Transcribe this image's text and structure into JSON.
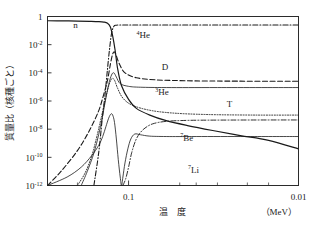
{
  "figure": {
    "kind": "scientific-plot",
    "background": "#ffffff",
    "ink": "#1a1a1a"
  },
  "axes": {
    "x_label": "温　度",
    "x_unit": "（MeV）",
    "x_ticks": [
      "0.1",
      "0.01"
    ],
    "y_label": "質量比（核種ごと）",
    "y_ticks": [
      "1",
      "10",
      "10",
      "10",
      "10",
      "10",
      "10"
    ],
    "y_tick_exponents": [
      "",
      "-2",
      "-4",
      "-6",
      "-8",
      "-10",
      "-12"
    ]
  },
  "chart_data": {
    "type": "line",
    "title": "",
    "xlabel": "温　度",
    "ylabel": "質量比（核種ごと）",
    "xunit": "MeV",
    "x_axis_scale": "log-reversed",
    "y_axis_scale": "log",
    "xlim": [
      0.3,
      0.01
    ],
    "ylim": [
      1e-12,
      1
    ],
    "grid": false,
    "legend": "inline-annotations",
    "x_tick_labels": [
      "0.1",
      "0.01"
    ],
    "y_tick_labels": [
      "1",
      "10^-2",
      "10^-4",
      "10^-6",
      "10^-8",
      "10^-10",
      "10^-12"
    ],
    "series": [
      {
        "name": "n",
        "label": "n",
        "style": "solid",
        "width": 1.2,
        "color": "#1a1a1a",
        "label_x": 0.205,
        "label_y": 0.15,
        "points": [
          [
            0.3,
            0.5
          ],
          [
            0.25,
            0.49
          ],
          [
            0.2,
            0.47
          ],
          [
            0.17,
            0.45
          ],
          [
            0.15,
            0.43
          ],
          [
            0.14,
            0.4
          ],
          [
            0.133,
            0.33
          ],
          [
            0.128,
            0.18
          ],
          [
            0.124,
            0.04
          ],
          [
            0.12,
            0.004
          ],
          [
            0.116,
            0.0002
          ],
          [
            0.11,
            1.2e-05
          ],
          [
            0.1,
            1.3e-06
          ],
          [
            0.09,
            3e-07
          ],
          [
            0.075,
            1e-07
          ],
          [
            0.06,
            4e-08
          ],
          [
            0.045,
            1.8e-08
          ],
          [
            0.032,
            8e-09
          ],
          [
            0.022,
            3.5e-09
          ],
          [
            0.015,
            1.6e-09
          ],
          [
            0.01,
            4e-10
          ]
        ]
      },
      {
        "name": "He4",
        "label": "4He",
        "mass_number": "4",
        "element": "He",
        "style": "dash-dot",
        "width": 1.1,
        "color": "#1a1a1a",
        "label_x": 0.082,
        "label_y": 0.03,
        "points": [
          [
            0.16,
            1e-12
          ],
          [
            0.15,
            2e-10
          ],
          [
            0.143,
            5e-08
          ],
          [
            0.138,
            2e-06
          ],
          [
            0.134,
            8e-05
          ],
          [
            0.13,
            0.003
          ],
          [
            0.126,
            0.06
          ],
          [
            0.122,
            0.2
          ],
          [
            0.118,
            0.24
          ],
          [
            0.11,
            0.25
          ],
          [
            0.09,
            0.25
          ],
          [
            0.06,
            0.25
          ],
          [
            0.03,
            0.25
          ],
          [
            0.01,
            0.25
          ]
        ]
      },
      {
        "name": "D",
        "label": "D",
        "style": "dashed",
        "width": 1.1,
        "color": "#1a1a1a",
        "label_x": 0.061,
        "label_y": 0.00015,
        "points": [
          [
            0.3,
            1e-12
          ],
          [
            0.25,
            1e-11
          ],
          [
            0.2,
            3e-10
          ],
          [
            0.17,
            8e-09
          ],
          [
            0.15,
            2e-07
          ],
          [
            0.14,
            3e-06
          ],
          [
            0.133,
            3e-05
          ],
          [
            0.128,
            0.0004
          ],
          [
            0.124,
            0.0022
          ],
          [
            0.121,
            0.003
          ],
          [
            0.118,
            0.0016
          ],
          [
            0.113,
            0.0004
          ],
          [
            0.105,
            0.0001
          ],
          [
            0.09,
            4.5e-05
          ],
          [
            0.07,
            3.2e-05
          ],
          [
            0.05,
            2.8e-05
          ],
          [
            0.03,
            2.6e-05
          ],
          [
            0.01,
            2.5e-05
          ]
        ]
      },
      {
        "name": "He3",
        "label": "3He",
        "mass_number": "3",
        "element": "He",
        "style": "solid-thin",
        "width": 0.8,
        "color": "#1a1a1a",
        "label_x": 0.0635,
        "label_y": 2.6e-06,
        "points": [
          [
            0.19,
            1e-12
          ],
          [
            0.175,
            1e-11
          ],
          [
            0.16,
            2e-10
          ],
          [
            0.15,
            4e-09
          ],
          [
            0.143,
            6e-08
          ],
          [
            0.137,
            1e-06
          ],
          [
            0.131,
            1.5e-05
          ],
          [
            0.126,
            7e-05
          ],
          [
            0.122,
            0.0001
          ],
          [
            0.118,
            5e-05
          ],
          [
            0.112,
            1.7e-05
          ],
          [
            0.1,
            1.1e-05
          ],
          [
            0.085,
            9.5e-06
          ],
          [
            0.06,
            9e-06
          ],
          [
            0.03,
            9e-06
          ],
          [
            0.01,
            9e-06
          ]
        ]
      },
      {
        "name": "T",
        "label": "T",
        "style": "dotted",
        "width": 0.9,
        "color": "#1a1a1a",
        "label_x": 0.0255,
        "label_y": 4e-07,
        "points": [
          [
            0.2,
            1e-12
          ],
          [
            0.18,
            8e-12
          ],
          [
            0.165,
            1.2e-10
          ],
          [
            0.155,
            2e-09
          ],
          [
            0.147,
            3e-08
          ],
          [
            0.14,
            4e-07
          ],
          [
            0.134,
            4e-06
          ],
          [
            0.129,
            2e-05
          ],
          [
            0.125,
            4e-05
          ],
          [
            0.121,
            3e-05
          ],
          [
            0.116,
            8e-06
          ],
          [
            0.108,
            1.6e-06
          ],
          [
            0.095,
            5e-07
          ],
          [
            0.075,
            2.2e-07
          ],
          [
            0.055,
            1.4e-07
          ],
          [
            0.035,
            1.1e-07
          ],
          [
            0.018,
            1e-07
          ],
          [
            0.01,
            1e-07
          ]
        ]
      },
      {
        "name": "Be7",
        "label": "7Be",
        "mass_number": "7",
        "element": "Be",
        "style": "dash-dot",
        "width": 0.9,
        "color": "#1a1a1a",
        "label_x": 0.0455,
        "label_y": 1.5e-09,
        "points": [
          [
            0.108,
            1e-12
          ],
          [
            0.104,
            3e-12
          ],
          [
            0.1,
            2e-11
          ],
          [
            0.096,
            2e-10
          ],
          [
            0.091,
            1.5e-09
          ],
          [
            0.086,
            5e-09
          ],
          [
            0.08,
            1.2e-08
          ],
          [
            0.072,
            2.4e-08
          ],
          [
            0.06,
            3.6e-08
          ],
          [
            0.045,
            4.2e-08
          ],
          [
            0.03,
            4.4e-08
          ],
          [
            0.015,
            4.5e-08
          ],
          [
            0.01,
            4.5e-08
          ]
        ]
      },
      {
        "name": "Li7",
        "label": "7Li",
        "mass_number": "7",
        "element": "Li",
        "style": "solid-thin",
        "width": 0.8,
        "color": "#1a1a1a",
        "label_x": 0.0415,
        "label_y": 8e-12,
        "points": [
          [
            0.3,
            1e-12
          ],
          [
            0.23,
            4e-12
          ],
          [
            0.19,
            2e-11
          ],
          [
            0.165,
            1.3e-10
          ],
          [
            0.15,
            7e-10
          ],
          [
            0.142,
            3e-09
          ],
          [
            0.136,
            1.5e-08
          ],
          [
            0.131,
            6e-08
          ],
          [
            0.127,
            1.2e-07
          ],
          [
            0.124,
            1e-07
          ],
          [
            0.121,
            3e-08
          ],
          [
            0.118,
            2e-09
          ],
          [
            0.115,
            7e-11
          ],
          [
            0.112,
            4e-12
          ],
          [
            0.11,
            1e-12
          ],
          [
            0.108,
            4e-12
          ],
          [
            0.105,
            4e-11
          ],
          [
            0.101,
            4e-10
          ],
          [
            0.097,
            2e-09
          ],
          [
            0.092,
            4.5e-09
          ],
          [
            0.085,
            4e-09
          ],
          [
            0.075,
            3.2e-09
          ],
          [
            0.06,
            3e-09
          ],
          [
            0.04,
            3e-09
          ],
          [
            0.02,
            3e-09
          ],
          [
            0.01,
            3e-09
          ]
        ]
      }
    ]
  }
}
